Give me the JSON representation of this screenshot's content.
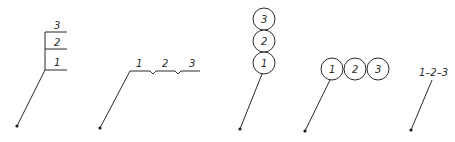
{
  "diagram": {
    "stroke_color": "#2a2a2a",
    "variants": [
      {
        "name": "shelf-stack",
        "labels": [
          "3",
          "2",
          "1"
        ]
      },
      {
        "name": "horizontal-notched",
        "labels": [
          "1",
          "2",
          "3"
        ]
      },
      {
        "name": "vertical-circles",
        "labels": [
          "3",
          "2",
          "1"
        ]
      },
      {
        "name": "horizontal-circles",
        "labels": [
          "1",
          "2",
          "3"
        ]
      },
      {
        "name": "dash-sequence",
        "label": "1–2–3"
      }
    ]
  }
}
